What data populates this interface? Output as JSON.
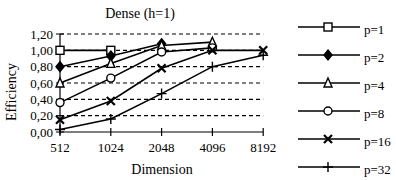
{
  "chart_data": {
    "type": "line",
    "title": "Dense (h=1)",
    "xlabel": "Dimension",
    "ylabel": "Efficiency",
    "categories": [
      "512",
      "1024",
      "2048",
      "4096",
      "8192"
    ],
    "y_ticks": [
      "0,00",
      "0,20",
      "0,40",
      "0,60",
      "0,80",
      "1,00",
      "1,20"
    ],
    "ylim": [
      0,
      1.2
    ],
    "grid": "horizontal-dashed",
    "legend_position": "right",
    "series": [
      {
        "name": "p=1",
        "marker": "square",
        "values": [
          1.0,
          1.0,
          null,
          null,
          null
        ]
      },
      {
        "name": "p=2",
        "marker": "diamond",
        "values": [
          0.8,
          0.93,
          1.08,
          null,
          null
        ]
      },
      {
        "name": "p=4",
        "marker": "triangle",
        "values": [
          0.6,
          0.84,
          1.06,
          1.1,
          null
        ]
      },
      {
        "name": "p=8",
        "marker": "circle",
        "values": [
          0.36,
          0.66,
          0.98,
          1.03,
          null
        ]
      },
      {
        "name": "p=16",
        "marker": "x",
        "values": [
          0.15,
          0.38,
          0.78,
          1.0,
          1.0
        ]
      },
      {
        "name": "p=32",
        "marker": "plus",
        "values": [
          0.03,
          0.16,
          0.47,
          0.8,
          0.94
        ]
      }
    ]
  }
}
